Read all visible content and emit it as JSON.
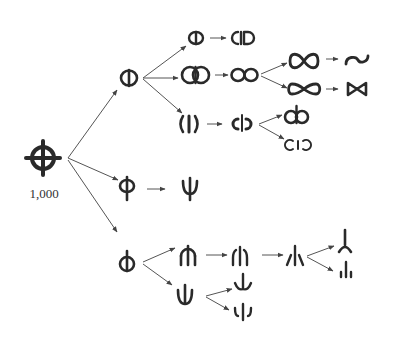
{
  "diagram": {
    "type": "glyph-evolution-tree",
    "root": {
      "id": "root",
      "glyph": "circle-with-cross",
      "label": "1,000"
    },
    "nodes": [
      {
        "id": "n1",
        "glyph": "circle-vertical-bar",
        "parent": "root"
      },
      {
        "id": "n1a",
        "glyph": "circle-vertical-bar-small",
        "parent": "n1"
      },
      {
        "id": "n1a1",
        "glyph": "open-c-bar-d",
        "parent": "n1a"
      },
      {
        "id": "n1b",
        "glyph": "double-circle-bar",
        "parent": "n1"
      },
      {
        "id": "n1b1",
        "glyph": "figure-eight-horizontal",
        "parent": "n1b"
      },
      {
        "id": "n1b1a",
        "glyph": "infinity",
        "parent": "n1b1"
      },
      {
        "id": "n1b1a1",
        "glyph": "s-curve",
        "parent": "n1b1a"
      },
      {
        "id": "n1b1b",
        "glyph": "bowtie",
        "parent": "n1b1"
      },
      {
        "id": "n1b1b1",
        "glyph": "bowtie-small",
        "parent": "n1b1b"
      },
      {
        "id": "n1c",
        "glyph": "parens-bar",
        "parent": "n1"
      },
      {
        "id": "n1c1",
        "glyph": "c-bar-reversed-c",
        "parent": "n1c"
      },
      {
        "id": "n1c1a",
        "glyph": "d-b-ligature",
        "parent": "n1c1"
      },
      {
        "id": "n1c1b",
        "glyph": "c-i-reversed-c",
        "parent": "n1c1"
      },
      {
        "id": "n2",
        "glyph": "phi",
        "parent": "root"
      },
      {
        "id": "n2a",
        "glyph": "psi",
        "parent": "n2"
      },
      {
        "id": "n3",
        "glyph": "circle-bar-top",
        "parent": "root"
      },
      {
        "id": "n3a",
        "glyph": "half-circle-bar",
        "parent": "n3"
      },
      {
        "id": "n3a1",
        "glyph": "open-arc-bar",
        "parent": "n3a"
      },
      {
        "id": "n3a2",
        "glyph": "slash-bar-slash",
        "parent": "n3a1"
      },
      {
        "id": "n3a2a",
        "glyph": "inverted-y",
        "parent": "n3a2"
      },
      {
        "id": "n3a2b",
        "glyph": "dot-bar-dot",
        "parent": "n3a2"
      },
      {
        "id": "n3b",
        "glyph": "u-bar",
        "parent": "n3"
      },
      {
        "id": "n3b1",
        "glyph": "trident-u",
        "parent": "n3b"
      },
      {
        "id": "n3b2",
        "glyph": "split-u",
        "parent": "n3b"
      }
    ]
  },
  "colors": {
    "ink": "#2a2a2a",
    "edge": "#555555",
    "background": "#ffffff"
  }
}
